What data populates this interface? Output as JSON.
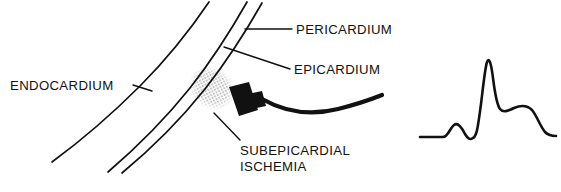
{
  "figure": {
    "background_color": "#ffffff",
    "ink_color": "#111111"
  },
  "labels": {
    "endocardium": "ENDOCARDIUM",
    "pericardium": "PERICARDIUM",
    "epicardium": "EPICARDIUM",
    "subepicardial_ischemia_line1": "SUBEPICARDIAL",
    "subepicardial_ischemia_line2": "ISCHEMIA"
  },
  "anatomy": {
    "endocardium_curve": "M 209 2 C 190 30 168 58 140 86 C 112 114 82 140 52 162",
    "epicardium_curve": "M 247 2 C 230 32 212 60 190 88 C 166 118 136 148 108 172",
    "pericardium_curve": "M 262 3 C 245 33 227 61 205 89 C 181 119 151 149 122 173",
    "ischemia_patch_cx": 212,
    "ischemia_patch_cy": 88,
    "ischemia_patch_rx": 21,
    "ischemia_patch_ry": 25,
    "ischemia_patch_rotate": -28
  },
  "leaders": {
    "endocardium": "M 133 85 L 152 91",
    "pericardium": "M 292 29 L 245 29",
    "epicardium": "M 290 69 L 224 47",
    "subepicardial_ischemia": "M 240 140 L 214 113"
  },
  "electrode": {
    "head_path": "M 229 87 L 249 82 L 258 110 L 239 116 Z",
    "stem_path": "M 243 95 L 262 91 L 266 106 L 247 110 Z",
    "cable_path": "M 262 99 C 285 112 310 116 338 109 C 358 104 372 99 382 95"
  },
  "ecg": {
    "label": "ECG trace — subepicardial ischemia pattern",
    "baseline_y": 137,
    "trace_path": "M 420 137 L 443 137 C 448 137 450 128 454 125 C 458 122 462 128 465 134 C 468 139 470 140 473 138 C 477 136 478 126 481 104 C 483 88 485 68 487 62 C 489 57 491 62 493 78 C 495 94 497 105 500 109 C 503 113 508 111 514 108 C 521 105 527 105 532 110 C 537 116 540 126 545 132 C 548 135 552 136 556 136"
  },
  "ecg_waveform_points": {
    "description": "Approximate y-offsets of the ECG trace read from the figure",
    "features": [
      {
        "name": "baseline-start",
        "x": 420,
        "y": 137
      },
      {
        "name": "p-wave-peak",
        "x": 454,
        "y": 125
      },
      {
        "name": "q-trough",
        "x": 466,
        "y": 139
      },
      {
        "name": "r-peak",
        "x": 487,
        "y": 61
      },
      {
        "name": "st-elevated-plateau",
        "x": 510,
        "y": 109
      },
      {
        "name": "t-wave-shoulder",
        "x": 527,
        "y": 106
      },
      {
        "name": "baseline-return",
        "x": 545,
        "y": 134
      },
      {
        "name": "baseline-end",
        "x": 556,
        "y": 136
      }
    ]
  },
  "text_positions": {
    "endocardium": {
      "x": 10,
      "y": 90
    },
    "pericardium": {
      "x": 296,
      "y": 34
    },
    "epicardium": {
      "x": 294,
      "y": 74
    },
    "subepicardial_ischemia_line1": {
      "x": 240,
      "y": 155
    },
    "subepicardial_ischemia_line2": {
      "x": 240,
      "y": 171
    }
  }
}
